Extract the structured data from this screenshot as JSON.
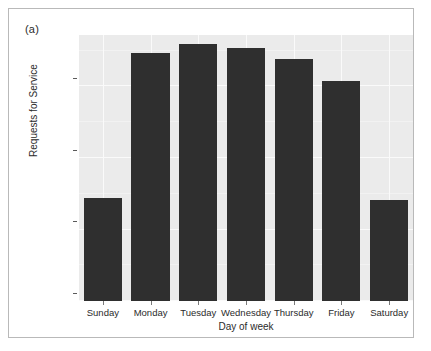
{
  "figure": {
    "panel_label": "(a)",
    "background_color": "#ffffff",
    "frame_border_color": "#b9b9b9"
  },
  "chart_data": {
    "type": "bar",
    "title": "",
    "subtitle": "",
    "xlabel": "Day of week",
    "ylabel": "Requests for Service",
    "categories": [
      "Sunday",
      "Monday",
      "Tuesday",
      "Wednesday",
      "Thursday",
      "Friday",
      "Saturday"
    ],
    "values": [
      71700,
      173600,
      179400,
      177200,
      169300,
      153500,
      70300
    ],
    "ylim": [
      0,
      186000
    ],
    "ytick_values": [
      0,
      50000,
      100000,
      150000
    ],
    "ytick_labels": [
      "0",
      "50000",
      "100000",
      "150000"
    ],
    "grid": true,
    "grid_color": "#fafafa",
    "legend": null,
    "bar_color": "#2f2f2f",
    "plot_background_color": "#ebebeb",
    "annotations": [
      "(a)"
    ]
  }
}
